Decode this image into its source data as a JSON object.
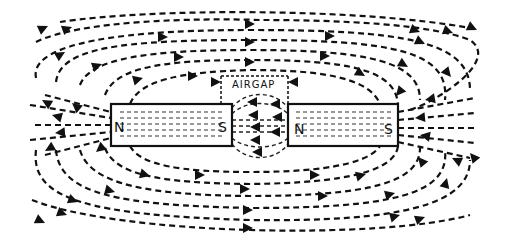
{
  "diagram": {
    "type": "magnetic-field-lines",
    "airgap_label": "AIRGAP",
    "magnets": [
      {
        "name": "left-magnet",
        "north_label": "N",
        "south_label": "S",
        "x": 111,
        "y": 104,
        "width": 121,
        "height": 42
      },
      {
        "name": "right-magnet",
        "north_label": "N",
        "south_label": "S",
        "x": 288,
        "y": 104,
        "width": 110,
        "height": 42
      }
    ],
    "colors": {
      "ink": "#111111",
      "background": "#ffffff"
    }
  }
}
